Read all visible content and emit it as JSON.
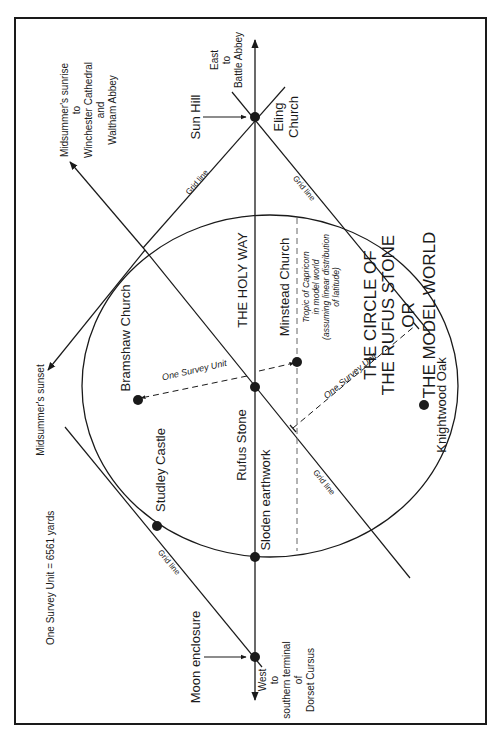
{
  "title": {
    "line1": "THE CIRCLE OF",
    "line2": "THE RUFUS STONE",
    "line3": "OR",
    "line4": "THE MODEL WORLD"
  },
  "scale_note": "One Survey Unit = 6561 yards",
  "axis": {
    "name": "THE HOLY WAY",
    "east": [
      "East",
      "to",
      "Battle Abbey"
    ],
    "west": [
      "West",
      "to",
      "southern terminal",
      "of",
      "Dorset Cursus"
    ]
  },
  "directions": {
    "midsummer_sunrise": [
      "Midsummer's sunrise",
      "to",
      "Winchester Cathedral",
      "and",
      "Waltham Abbey"
    ],
    "midsummer_sunset": "Midsummer's sunset"
  },
  "grid_line_label": "Grid line",
  "survey_unit_label": "One Survey Unit",
  "tropic": [
    "Tropic of Capricorn",
    "in model world",
    "(assuming linear distribution",
    "of latitude)"
  ],
  "sites": {
    "sun_hill": "Sun Hill",
    "eling_church": [
      "Eling",
      "Church"
    ],
    "moon_enclosure": "Moon enclosure",
    "rufus_stone": "Rufus Stone",
    "sloden_earthwork": "Sloden earthwork",
    "minstead_church": "Minstead Church",
    "bramshaw_church": "Bramshaw Church",
    "studley_castle": "Studley Castle",
    "knightwood_oak": "Knightwood Oak"
  },
  "colors": {
    "ink": "#1a1a1a",
    "background": "#ffffff",
    "dashed": "#555555"
  }
}
